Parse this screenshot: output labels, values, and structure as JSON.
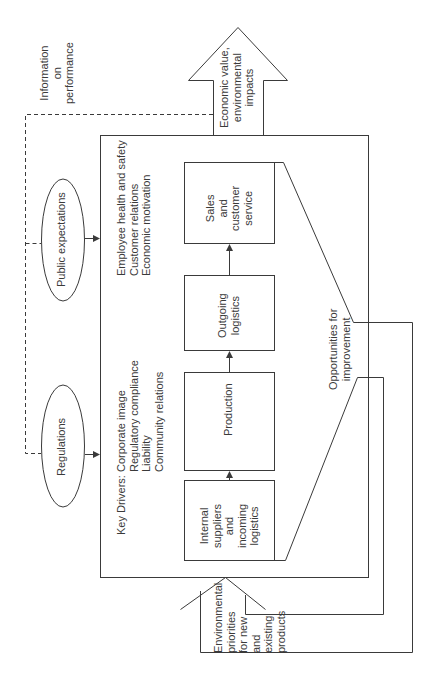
{
  "diagram": {
    "orientation": "rotated -90deg",
    "output_arrow": {
      "label_lines": [
        "Economic value,",
        "environmental",
        "impacts"
      ]
    },
    "feedback_label": {
      "lines": [
        "Information",
        "on",
        "performance"
      ]
    },
    "external_inputs": [
      {
        "id": "public-expectations",
        "label": "Public expectations"
      },
      {
        "id": "regulations",
        "label": "Regulations"
      }
    ],
    "key_drivers": {
      "heading": "Key Drivers:",
      "group1": [
        "Corporate image",
        "Regulatory compliance",
        "Liability",
        "Community relations"
      ],
      "group2": [
        "Employee health and safety",
        "Customer relations",
        "Economic motivation"
      ]
    },
    "process_steps": [
      {
        "id": "internal-suppliers",
        "lines": [
          "Internal",
          "suppliers",
          "and",
          "incoming",
          "logistics"
        ]
      },
      {
        "id": "production",
        "lines": [
          "Production"
        ]
      },
      {
        "id": "outgoing-logistics",
        "lines": [
          "Outgoing",
          "logistics"
        ]
      },
      {
        "id": "sales",
        "lines": [
          "Sales",
          "and",
          "customer",
          "service"
        ]
      }
    ],
    "opportunities_label": {
      "lines": [
        "Opportunities for",
        "improvement"
      ]
    },
    "input_arrow": {
      "label_lines": [
        "Environmental",
        "priorities",
        "for new",
        "and",
        "existing",
        "products"
      ]
    },
    "colors": {
      "line": "#3a3a3a",
      "text": "#3a3a3a",
      "background": "#ffffff"
    }
  }
}
